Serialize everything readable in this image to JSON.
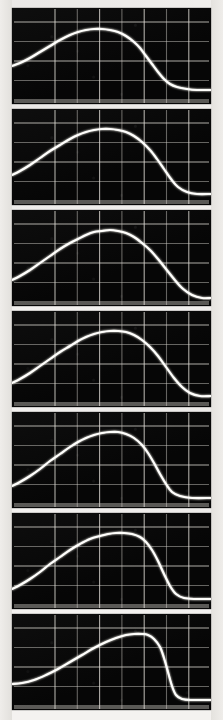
{
  "figure": {
    "kind": "oscilloscope-trace-strip",
    "panel_count": 7,
    "background_color": "#f4f2f0",
    "screen_color": "#060606",
    "trace_color": "#fdfcf6",
    "grid_color": "#d9d6cf"
  },
  "layout": {
    "image_width": 223,
    "image_height": 720,
    "panel_left": 12,
    "panel_width": 199,
    "panel_height": 96,
    "panel_gap": 5,
    "panel_tops": [
      8,
      109,
      210,
      311,
      412,
      513,
      614
    ]
  },
  "chart_data": {
    "type": "line",
    "subtitle": "Seven successive sweeps of a rising-plateau-falling pulse",
    "xlabel": "",
    "ylabel": "",
    "xlim": [
      0,
      199
    ],
    "ylim": [
      0,
      96
    ],
    "grid": true,
    "legend_position": "none",
    "graticule": {
      "x_divisions": 8,
      "y_divisions": 4,
      "x_start": 43,
      "x_step": 22.3,
      "y_start": 14,
      "y_step": 19.5
    },
    "series": [
      {
        "name": "panel-1",
        "panel": 1,
        "description": "Broad plateau peaking early-mid, sharp fall to baseline at right",
        "x": [
          0,
          8,
          18,
          28,
          38,
          48,
          58,
          66,
          74,
          82,
          90,
          98,
          106,
          114,
          122,
          128,
          134,
          140,
          146,
          152,
          158,
          165,
          175,
          185,
          199
        ],
        "y": [
          58,
          55,
          50,
          44,
          38,
          32,
          27,
          24,
          22,
          21,
          21,
          22,
          24,
          28,
          34,
          40,
          48,
          56,
          64,
          71,
          76,
          79,
          81,
          82,
          82
        ]
      },
      {
        "name": "panel-2",
        "panel": 2,
        "description": "Rounded plateau slightly later, steep trailing edge",
        "x": [
          0,
          8,
          18,
          28,
          38,
          48,
          58,
          66,
          74,
          82,
          90,
          98,
          106,
          114,
          122,
          130,
          138,
          145,
          152,
          159,
          166,
          175,
          185,
          199
        ],
        "y": [
          66,
          62,
          56,
          49,
          42,
          36,
          30,
          26,
          23,
          21,
          20,
          20,
          21,
          23,
          27,
          33,
          41,
          50,
          60,
          70,
          78,
          83,
          85,
          85
        ]
      },
      {
        "name": "panel-3",
        "panel": 3,
        "description": "Symmetric dome, peak near mid-screen",
        "x": [
          0,
          8,
          18,
          28,
          38,
          48,
          58,
          66,
          74,
          82,
          90,
          98,
          106,
          114,
          122,
          130,
          138,
          146,
          154,
          162,
          170,
          180,
          190,
          199
        ],
        "y": [
          70,
          66,
          60,
          53,
          46,
          39,
          33,
          29,
          25,
          22,
          21,
          20,
          21,
          23,
          27,
          33,
          40,
          49,
          59,
          69,
          78,
          85,
          88,
          88
        ]
      },
      {
        "name": "panel-4",
        "panel": 4,
        "description": "Flatter top, trailing edge shifted right",
        "x": [
          0,
          8,
          18,
          28,
          38,
          48,
          58,
          66,
          74,
          82,
          90,
          98,
          106,
          114,
          122,
          130,
          138,
          146,
          154,
          162,
          170,
          178,
          188,
          199
        ],
        "y": [
          72,
          68,
          62,
          55,
          48,
          41,
          35,
          30,
          26,
          23,
          21,
          20,
          20,
          21,
          24,
          29,
          36,
          45,
          56,
          67,
          76,
          82,
          85,
          85
        ]
      },
      {
        "name": "panel-5",
        "panel": 5,
        "description": "Narrower dome, faster fall-off after peak",
        "x": [
          0,
          8,
          18,
          28,
          38,
          48,
          58,
          66,
          74,
          82,
          90,
          98,
          106,
          114,
          122,
          130,
          136,
          142,
          148,
          154,
          160,
          168,
          180,
          199
        ],
        "y": [
          74,
          70,
          64,
          57,
          49,
          42,
          35,
          30,
          26,
          23,
          21,
          20,
          20,
          22,
          26,
          33,
          41,
          51,
          62,
          72,
          80,
          84,
          86,
          86
        ]
      },
      {
        "name": "panel-6",
        "panel": 6,
        "description": "Peak shifted right, very steep trailing edge to flat tail",
        "x": [
          0,
          8,
          18,
          28,
          38,
          48,
          58,
          68,
          78,
          88,
          96,
          104,
          112,
          120,
          128,
          134,
          140,
          146,
          152,
          158,
          164,
          172,
          184,
          199
        ],
        "y": [
          76,
          72,
          66,
          59,
          51,
          44,
          37,
          31,
          26,
          23,
          21,
          20,
          20,
          21,
          24,
          29,
          37,
          48,
          61,
          73,
          81,
          85,
          86,
          86
        ]
      },
      {
        "name": "panel-7",
        "panel": 7,
        "description": "Late slow rise, narrow peak near right, abrupt drop to baseline",
        "x": [
          0,
          10,
          22,
          34,
          46,
          58,
          70,
          82,
          94,
          104,
          114,
          122,
          130,
          136,
          142,
          148,
          152,
          156,
          160,
          164,
          170,
          180,
          199
        ],
        "y": [
          70,
          69,
          66,
          61,
          55,
          48,
          41,
          34,
          28,
          24,
          21,
          20,
          20,
          21,
          25,
          33,
          44,
          58,
          72,
          81,
          85,
          86,
          86
        ]
      }
    ]
  }
}
